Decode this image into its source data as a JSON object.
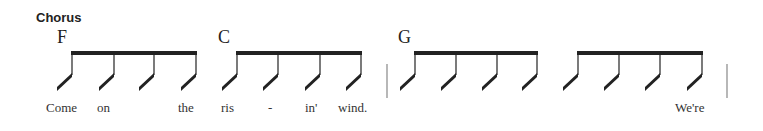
{
  "section": {
    "label": "Chorus"
  },
  "colors": {
    "ink": "#222222",
    "barline": "#888888",
    "lyric": "#333333"
  },
  "measures": [
    {
      "chord": "F",
      "chord_x": 57,
      "stems": [
        72,
        114,
        154,
        196
      ],
      "lyrics": [
        {
          "text": "Come",
          "x": 46
        },
        {
          "text": "on",
          "x": 97
        },
        {
          "text": "the",
          "x": 178
        }
      ]
    },
    {
      "chord": "C",
      "chord_x": 218,
      "stems": [
        237,
        278,
        320,
        361
      ],
      "lyrics": [
        {
          "text": "ris",
          "x": 221
        },
        {
          "text": "-",
          "x": 268
        },
        {
          "text": "in'",
          "x": 305
        },
        {
          "text": "wind.",
          "x": 338
        }
      ]
    },
    {
      "chord": "G",
      "chord_x": 398,
      "stems": [
        415,
        456,
        497,
        537
      ],
      "lyrics": []
    },
    {
      "chord": "",
      "chord_x": 0,
      "stems": [
        578,
        619,
        660,
        702
      ],
      "lyrics": [
        {
          "text": "We're",
          "x": 675
        }
      ]
    }
  ],
  "barlines": [
    387,
    727
  ]
}
